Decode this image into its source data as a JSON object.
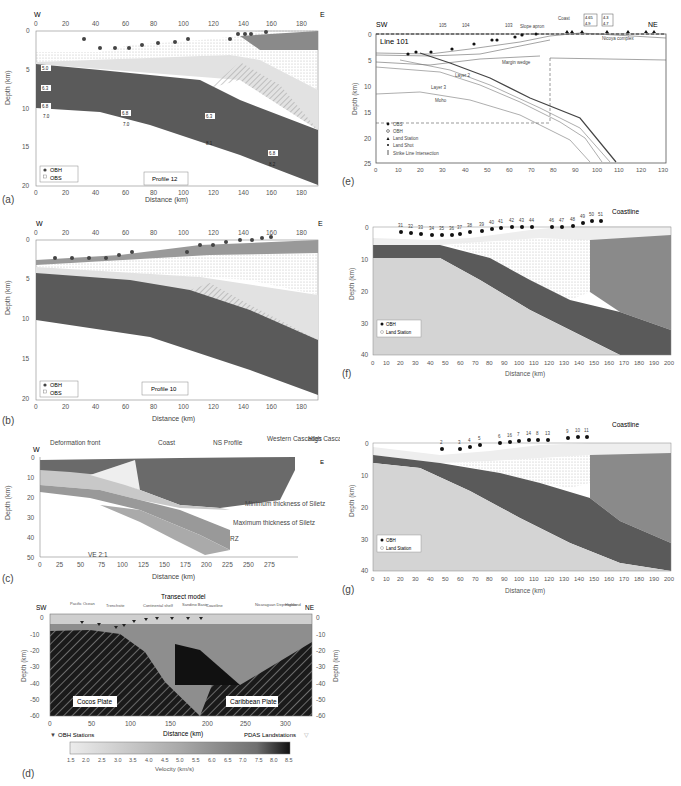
{
  "figure": {
    "panels": [
      {
        "id": "a",
        "label": "(a)",
        "left_edge_label": "W",
        "right_edge_label": "E",
        "title_box": "Profile 12",
        "xlabel": "Distance (km)",
        "ylabel": "Depth (km)",
        "x_ticks": [
          "0",
          "20",
          "40",
          "60",
          "80",
          "100",
          "120",
          "140",
          "160",
          "180"
        ],
        "y_ticks": [
          "0",
          "5",
          "10",
          "15",
          "20"
        ],
        "legend": [
          "OBH",
          "OBS"
        ],
        "velocity_labels": [
          "2.1",
          "2.5",
          "1.7",
          "1.8",
          "2.4",
          "2.7",
          "3.1",
          "3.6",
          "4.0",
          "4.1",
          "4.3",
          "4.4",
          "4.8",
          "4.9",
          "5.0",
          "5.5",
          "5.6",
          "6.2",
          "6.3",
          "6.8",
          "7.0",
          "7.9",
          "8.1",
          "8.2"
        ]
      },
      {
        "id": "b",
        "label": "(b)",
        "left_edge_label": "W",
        "right_edge_label": "E",
        "title_box": "Profile 10",
        "xlabel": "Distance (km)",
        "ylabel": "Depth (km)",
        "x_ticks": [
          "0",
          "20",
          "40",
          "60",
          "80",
          "100",
          "120",
          "140",
          "160",
          "180"
        ],
        "y_ticks": [
          "0",
          "5",
          "10",
          "15",
          "20"
        ],
        "legend": [
          "OBH",
          "OBS"
        ],
        "velocity_labels": [
          "2.3",
          "2.4",
          "1.7",
          "2.0",
          "2.7",
          "3.1",
          "3.5",
          "3.6",
          "4.4",
          "4.5",
          "4.6",
          "4.8",
          "4.9",
          "5.0",
          "5.4",
          "6.0",
          "6.4",
          "6.9",
          "7.0",
          "7.5",
          "8.0",
          "8.3"
        ]
      },
      {
        "id": "c",
        "label": "(c)",
        "left_edge_label": "W",
        "right_edge_label": "E",
        "xlabel": "Distance (km)",
        "ylabel": "Depth (km)",
        "x_ticks": [
          "0",
          "25",
          "50",
          "75",
          "100",
          "125",
          "150",
          "175",
          "200",
          "225",
          "250",
          "275"
        ],
        "y_ticks": [
          "0",
          "10",
          "20",
          "30",
          "40",
          "50"
        ],
        "annotations": [
          "Deformation front",
          "Coast",
          "NS Profile",
          "Western Cascades",
          "High Cascades",
          "Minimum thickness of Siletz",
          "Maximum thickness of Siletz",
          "RZ",
          "VE 2:1"
        ],
        "velocity_labels": [
          "5.0",
          "6.0",
          "6.5",
          "6.6",
          "7.0",
          "7.5",
          "8.0"
        ]
      },
      {
        "id": "d",
        "label": "(d)",
        "title": "Transect model",
        "left_edge_label": "SW",
        "right_edge_label": "NE",
        "xlabel": "Distance (km)",
        "ylabel": "Depth (km)",
        "x_ticks": [
          "0",
          "50",
          "100",
          "150",
          "200",
          "250",
          "300"
        ],
        "y_ticks": [
          "0",
          "-10",
          "-20",
          "-30",
          "-40",
          "-50",
          "-60"
        ],
        "regions": [
          "Pacific Ocean",
          "Trenchsite",
          "Continental shelf",
          "Sandino Basin",
          "Coastline",
          "Nicaraguan Depression",
          "Highland"
        ],
        "plates": [
          "Cocos Plate",
          "Caribbean Plate"
        ],
        "legend_left": "OBH Stations",
        "legend_right": "PDAS Landstations",
        "colorbar": {
          "label": "Velocity (km/s)",
          "ticks": [
            "1.5",
            "2.0",
            "2.5",
            "3.0",
            "3.5",
            "4.0",
            "4.5",
            "5.0",
            "5.5",
            "6.0",
            "6.5",
            "7.0",
            "7.5",
            "8.0",
            "8.5"
          ]
        }
      },
      {
        "id": "e",
        "label": "(e)",
        "title": "Line 101",
        "left_edge_label": "SW",
        "right_edge_label": "NE",
        "xlabel": "",
        "ylabel": "Depth (km)",
        "x_ticks": [
          "0",
          "10",
          "20",
          "30",
          "40",
          "50",
          "60",
          "70",
          "80",
          "90",
          "100",
          "110",
          "120",
          "130"
        ],
        "y_ticks": [
          "0",
          "5",
          "10",
          "15",
          "20",
          "25"
        ],
        "strike_lines": [
          "105",
          "104",
          "103"
        ],
        "annotations": [
          "Slope apron",
          "Coast",
          "Nicoya complex",
          "Margin wedge",
          "Layer 2",
          "Layer 3",
          "Moho"
        ],
        "boxed_values": [
          [
            "4.65",
            "4.9"
          ],
          [
            "4.3",
            "4.7"
          ]
        ],
        "legend": [
          "OBS",
          "OBH",
          "Land Station",
          "Land Shot",
          "Strike Line Intersection"
        ],
        "velocity_labels": [
          "1.6-1.7",
          "1.75",
          "1.75-1.95",
          "3.4",
          "3.7",
          "3.75",
          "4.0",
          "4.2",
          "4.6",
          "4.65",
          "4.85",
          "5.0",
          "5.25",
          "5.3",
          "5.45",
          "5.5",
          "5.8",
          "5.85",
          "5.95",
          "6.7",
          "6.8",
          "6.85",
          "6.95",
          "7.2",
          "8.1"
        ]
      },
      {
        "id": "f",
        "label": "(f)",
        "coastline_label": "Coastline",
        "xlabel": "Distance (km)",
        "ylabel": "Depth (km)",
        "x_ticks": [
          "0",
          "10",
          "20",
          "30",
          "40",
          "50",
          "60",
          "70",
          "80",
          "90",
          "100",
          "110",
          "120",
          "130",
          "140",
          "150",
          "160",
          "170",
          "180",
          "190",
          "200"
        ],
        "y_ticks": [
          "0",
          "10",
          "20",
          "30",
          "40"
        ],
        "station_numbers": [
          "31",
          "32",
          "33",
          "34",
          "35",
          "36",
          "37",
          "38",
          "39",
          "40",
          "41",
          "42",
          "43",
          "44",
          "46",
          "47",
          "48",
          "49",
          "50",
          "51"
        ],
        "legend": [
          "OBH",
          "Land Station"
        ],
        "velocity_labels": [
          "4.5",
          "6.0",
          "6.2",
          "7.0",
          "8.1",
          "2.1",
          "2.3",
          "3.0",
          "3.1",
          "4.0",
          "4.2",
          "5.5",
          "5.7",
          "6.0",
          "6.3",
          "6.4",
          "6.6",
          "6.7",
          "6.8",
          "7.1"
        ]
      },
      {
        "id": "g",
        "label": "(g)",
        "coastline_label": "Coastline",
        "xlabel": "Distance (km)",
        "ylabel": "Depth (km)",
        "x_ticks": [
          "0",
          "10",
          "20",
          "30",
          "40",
          "50",
          "60",
          "70",
          "80",
          "90",
          "100",
          "110",
          "120",
          "130",
          "140",
          "150",
          "160",
          "170",
          "180",
          "190",
          "200"
        ],
        "y_ticks": [
          "0",
          "10",
          "20",
          "30",
          "40"
        ],
        "station_numbers": [
          "2",
          "3",
          "4",
          "5",
          "6",
          "16",
          "7",
          "14",
          "8",
          "13",
          "9",
          "10",
          "11"
        ],
        "legend": [
          "OBH",
          "Land Station"
        ],
        "velocity_labels": [
          "4.6",
          "6.0",
          "6.4",
          "6.8",
          "8.0",
          "2.0",
          "3.0",
          "3.3",
          "3.7",
          "3.9",
          "4.0",
          "4.8",
          "5.0",
          "5.3",
          "5.4",
          "6.0",
          "6.5",
          "6.6",
          "6.7",
          "7.0",
          "7.2",
          "8.1",
          "8.5"
        ]
      }
    ],
    "colors": {
      "mantle_dark": "#5a5a5a",
      "crust_mid": "#8a8a8a",
      "sediment_light": "#d8d8d8",
      "lower_plate": "#c8c8c8",
      "black_slab": "#1a1a1a",
      "axis": "#555555"
    }
  }
}
